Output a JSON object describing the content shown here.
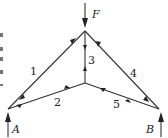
{
  "diagram": {
    "type": "truss",
    "nodes": {
      "top": {
        "x": 85,
        "y": 31
      },
      "center": {
        "x": 85,
        "y": 83
      },
      "A": {
        "x": 8,
        "y": 109
      },
      "B": {
        "x": 159,
        "y": 109
      }
    },
    "labels": {
      "load": "F",
      "support_left": "A",
      "support_right": "B",
      "member_1": "1",
      "member_2": "2",
      "member_3": "3",
      "member_4": "4",
      "member_5": "5"
    },
    "members": [
      {
        "id": "1",
        "from": "A",
        "to": "top"
      },
      {
        "id": "2",
        "from": "A",
        "to": "center"
      },
      {
        "id": "3",
        "from": "top",
        "to": "center"
      },
      {
        "id": "4",
        "from": "top",
        "to": "B"
      },
      {
        "id": "5",
        "from": "center",
        "to": "B"
      }
    ],
    "line_color": "#333333"
  }
}
